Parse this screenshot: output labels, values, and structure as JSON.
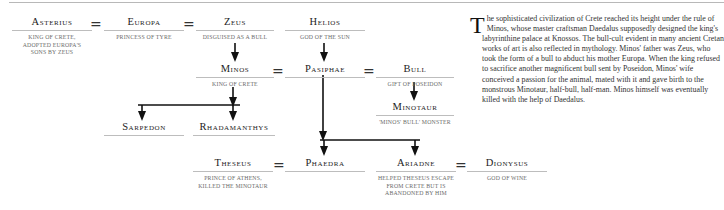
{
  "tree": {
    "nodes": {
      "asterius": {
        "name": "Asterius",
        "desc_lines": [
          "King of Crete,",
          "adopted Europa's",
          "sons by Zeus"
        ]
      },
      "europa": {
        "name": "Europa",
        "desc_lines": [
          "Princess of Tyre"
        ]
      },
      "zeus": {
        "name": "Zeus",
        "desc_lines": [
          "Disguised as a bull"
        ]
      },
      "helios": {
        "name": "Helios",
        "desc_lines": [
          "God of the sun"
        ]
      },
      "minos": {
        "name": "Minos",
        "desc_lines": [
          "King of Crete"
        ]
      },
      "pasiphae": {
        "name": "Pasiphae",
        "desc_lines": []
      },
      "bull": {
        "name": "Bull",
        "desc_lines": [
          "Gift of Poseidon"
        ]
      },
      "minotaur": {
        "name": "Minotaur",
        "desc_lines": [
          "'Minos' bull' monster"
        ]
      },
      "sarpedon": {
        "name": "Sarpedon",
        "desc_lines": []
      },
      "rhadamanthys": {
        "name": "Rhadamanthys",
        "desc_lines": []
      },
      "theseus": {
        "name": "Theseus",
        "desc_lines": [
          "Prince of Athens,",
          "killed the Minotaur"
        ]
      },
      "phaedra": {
        "name": "Phaedra",
        "desc_lines": []
      },
      "ariadne": {
        "name": "Ariadne",
        "desc_lines": [
          "Helped Theseus escape",
          "from Crete but is",
          "abandoned by him"
        ]
      },
      "dionysus": {
        "name": "Dionysus",
        "desc_lines": [
          "God of wine"
        ]
      }
    },
    "marriage_symbol": "="
  },
  "text": {
    "dropcap": "T",
    "body": "he sophisticated civilization of Crete reached its height under the rule of Minos, whose master craftsman Daedalus supposedly designed the king's labyrinthine palace at Knossos. The bull-cult evident in many ancient Cretan works of art is also reflected in mythology. Minos' father was Zeus, who took the form of a bull to abduct his mother Europa. When the king refused to sacrifice another magnificent bull sent by Poseidon, Minos' wife conceived a passion for the animal, mated with it and gave birth to the monstrous Minotaur, half-bull, half-man. Minos himself was eventually killed with the help of Daedalus."
  },
  "colors": {
    "rule": "#bdbdbd",
    "line": "#111111",
    "desc_text": "#6a6a6a",
    "body_text": "#333333"
  }
}
